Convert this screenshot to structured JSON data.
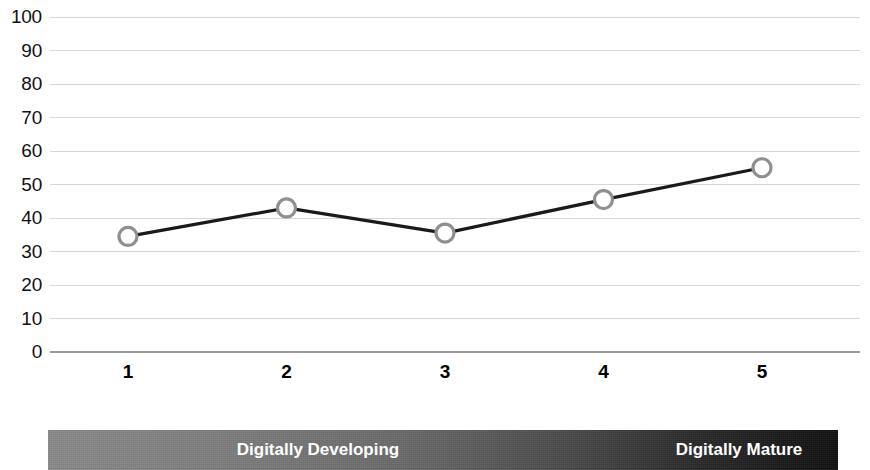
{
  "chart_data": {
    "type": "line",
    "title": "",
    "subtitle": "",
    "xlabel": "",
    "ylabel": "",
    "x": [
      1,
      2,
      3,
      4,
      5
    ],
    "categories": [
      "1",
      "2",
      "3",
      "4",
      "5"
    ],
    "values": [
      34.5,
      43,
      35.5,
      45.5,
      55
    ],
    "series": [
      {
        "name": "",
        "values": [
          34.5,
          43,
          35.5,
          45.5,
          55
        ]
      }
    ],
    "ylim": [
      0,
      100
    ],
    "y_ticks": [
      0,
      10,
      20,
      30,
      40,
      50,
      60,
      70,
      80,
      90,
      100
    ],
    "y_tick_labels": [
      "0",
      "10",
      "20",
      "30",
      "40",
      "50",
      "60",
      "70",
      "80",
      "90",
      "100"
    ],
    "x_tick_labels": [
      "1",
      "2",
      "3",
      "4",
      "5"
    ],
    "grid": true,
    "grid_axis": "y",
    "legend": false,
    "legend_position": "none",
    "line_color": "#1a1a1a",
    "marker": "open-circle",
    "marker_edge_color": "#8f8f8f",
    "marker_face_color": "#ffffff",
    "gridline_color": "#d7d7d7",
    "axis_color": "#9a9a9a",
    "annotations": [
      {
        "text": "Digitally Developing",
        "position": "bottom-left"
      },
      {
        "text": "Digitally Mature",
        "position": "bottom-right"
      }
    ]
  },
  "spectrum": {
    "left_label": "Digitally Developing",
    "right_label": "Digitally Mature",
    "gradient_start": "#8a8a8a",
    "gradient_end": "#111111",
    "text_color": "#ffffff"
  }
}
